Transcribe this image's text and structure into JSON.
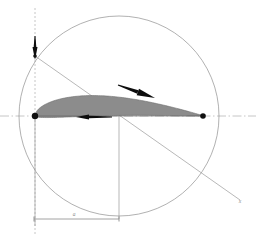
{
  "figure": {
    "type": "airfoil-geometry-diagram",
    "background_color": "#ffffff",
    "width": 256,
    "height": 241
  },
  "colors": {
    "axis": "#b8b8b8",
    "construction_line": "#9a9a9a",
    "circle_stroke": "#8f8f8f",
    "airfoil_fill": "#8c8c8c",
    "airfoil_stroke": "#6f6f6f",
    "marker_dark": "#111111",
    "arrow_dark": "#0d0d0d",
    "dimension_line": "#8a8a8a",
    "text": "#8a8a8a"
  },
  "axes": {
    "horizontal": {
      "name": "chord-axis",
      "y": 116,
      "x_start": 0,
      "x_end": 256,
      "style": "dash-dot"
    },
    "vertical": {
      "name": "leading-edge-axis",
      "x": 35,
      "y_start": 8,
      "y_end": 236,
      "style": "dashed"
    }
  },
  "circle": {
    "name": "reference-circle",
    "center_x": 119,
    "center_y": 116,
    "radius": 100
  },
  "airfoil": {
    "name": "airfoil-section",
    "leading_edge": {
      "x": 35,
      "y": 116
    },
    "trailing_edge": {
      "x": 203,
      "y": 116
    },
    "chord_length_px": 168,
    "max_thickness_px": 22,
    "max_thickness_x": 82
  },
  "markers": [
    {
      "name": "leading-edge-point",
      "x": 35,
      "y": 116,
      "r": 3.2
    },
    {
      "name": "trailing-edge-point",
      "x": 203,
      "y": 116,
      "r": 2.8
    },
    {
      "name": "axis-origin-point",
      "x": 35,
      "y": 56,
      "r": 1.8
    }
  ],
  "arrows": [
    {
      "name": "vertical-down-arrow",
      "from_x": 35,
      "from_y": 36,
      "to_x": 35,
      "to_y": 60,
      "head_width": 5
    },
    {
      "name": "chord-left-arrow",
      "from_x": 112,
      "from_y": 117,
      "to_x": 76,
      "to_y": 117,
      "head_width": 5
    },
    {
      "name": "upper-surface-arrow",
      "from_x": 118,
      "from_y": 85,
      "to_x": 155,
      "to_y": 98,
      "head_width": 7
    }
  ],
  "construction_lines": [
    {
      "name": "angle-ray",
      "x1": 35,
      "y1": 56,
      "x2": 240,
      "y2": 200
    },
    {
      "name": "center-drop-line",
      "x1": 119,
      "y1": 116,
      "x2": 119,
      "y2": 219
    },
    {
      "name": "leading-edge-extension",
      "x1": 35,
      "y1": 116,
      "x2": 35,
      "y2": 226
    }
  ],
  "dimension": {
    "name": "chord-position-dimension",
    "y": 219,
    "x_start": 34,
    "x_end": 119,
    "label": "a",
    "label_x": 74,
    "label_y": 216,
    "tick_size": 5
  },
  "labels": [
    {
      "name": "ray-end-label",
      "text": "x",
      "x": 240,
      "y": 203
    }
  ]
}
